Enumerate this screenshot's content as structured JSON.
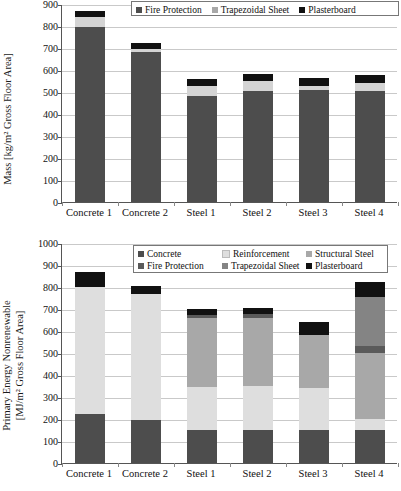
{
  "chart_data": [
    {
      "type": "bar",
      "subtype": "stacked-bar",
      "title": "",
      "xlabel": "",
      "ylabel": "Mass [kg/m² Gross Floor Area]",
      "ylim": [
        0,
        900
      ],
      "ytick_step": 100,
      "yticks": [
        "900",
        "800",
        "700",
        "600",
        "500",
        "400",
        "300",
        "200",
        "100",
        "0"
      ],
      "grid": true,
      "legend_position": "top-right",
      "categories": [
        "Concrete 1",
        "Concrete 2",
        "Steel 1",
        "Steel 2",
        "Steel 3",
        "Steel 4"
      ],
      "series": [
        {
          "name": "Fire Protection",
          "color": "#4d4d4d",
          "values": [
            795,
            684,
            483,
            505,
            508,
            503
          ]
        },
        {
          "name": "Trapezoidal Sheet",
          "color": "#d4d4d4",
          "values": [
            45,
            12,
            43,
            45,
            18,
            36
          ]
        },
        {
          "name": "Plasterboard",
          "color": "#111111",
          "values": [
            28,
            28,
            35,
            32,
            40,
            38
          ]
        }
      ],
      "totals": [
        868,
        724,
        561,
        582,
        566,
        577
      ]
    },
    {
      "type": "bar",
      "subtype": "stacked-bar",
      "title": "",
      "xlabel": "",
      "ylabel": "Primary Energy Nonrenewable [MJ/m² Gross Floor Area]",
      "ylim": [
        0,
        1000
      ],
      "ytick_step": 100,
      "yticks": [
        "1000",
        "900",
        "800",
        "700",
        "600",
        "500",
        "400",
        "300",
        "200",
        "100",
        "0"
      ],
      "grid": true,
      "legend_position": "top-center",
      "categories": [
        "Concrete 1",
        "Concrete 2",
        "Steel 1",
        "Steel 2",
        "Steel 3",
        "Steel 4"
      ],
      "series": [
        {
          "name": "Concrete",
          "color": "#4d4d4d",
          "values": [
            225,
            197,
            150,
            150,
            148,
            150
          ]
        },
        {
          "name": "Reinforcement",
          "color": "#dedede",
          "values": [
            575,
            570,
            195,
            200,
            192,
            50
          ]
        },
        {
          "name": "Structural Steel",
          "color": "#a8a8a8",
          "values": [
            0,
            0,
            315,
            310,
            240,
            300
          ]
        },
        {
          "name": "Fire Protection",
          "color": "#5a5a5a",
          "values": [
            0,
            0,
            15,
            18,
            0,
            30
          ]
        },
        {
          "name": "Trapezoidal Sheet",
          "color": "#848484",
          "values": [
            0,
            0,
            0,
            0,
            0,
            225
          ]
        },
        {
          "name": "Plasterboard",
          "color": "#111111",
          "values": [
            70,
            38,
            27,
            25,
            60,
            68
          ]
        }
      ],
      "totals": [
        870,
        805,
        702,
        703,
        640,
        823
      ]
    }
  ],
  "chart_top": {
    "ylabel": "Mass [kg/m² Gross Floor Area]",
    "yticks": [
      "900",
      "800",
      "700",
      "600",
      "500",
      "400",
      "300",
      "200",
      "100",
      "0"
    ],
    "xlabels": [
      "Concrete 1",
      "Concrete 2",
      "Steel 1",
      "Steel 2",
      "Steel 3",
      "Steel 4"
    ],
    "legend": [
      {
        "label": "Fire Protection",
        "color": "#4d4d4d"
      },
      {
        "label": "Trapezoidal Sheet",
        "color": "#a8a8a8"
      },
      {
        "label": "Plasterboard",
        "color": "#111111"
      }
    ]
  },
  "chart_bottom": {
    "ylabel_line1": "Primary Energy Nonrenewable",
    "ylabel_line2": "[MJ/m² Gross Floor Area]",
    "yticks": [
      "1000",
      "900",
      "800",
      "700",
      "600",
      "500",
      "400",
      "300",
      "200",
      "100",
      "0"
    ],
    "xlabels": [
      "Concrete 1",
      "Concrete 2",
      "Steel 1",
      "Steel 2",
      "Steel 3",
      "Steel 4"
    ],
    "legend_row1": [
      {
        "label": "Concrete",
        "color": "#4d4d4d"
      },
      {
        "label": "Reinforcement",
        "color": "#dedede"
      },
      {
        "label": "Structural Steel",
        "color": "#a8a8a8"
      }
    ],
    "legend_row2": [
      {
        "label": "Fire Protection",
        "color": "#5a5a5a"
      },
      {
        "label": "Trapezoidal Sheet",
        "color": "#848484"
      },
      {
        "label": "Plasterboard",
        "color": "#111111"
      }
    ]
  }
}
